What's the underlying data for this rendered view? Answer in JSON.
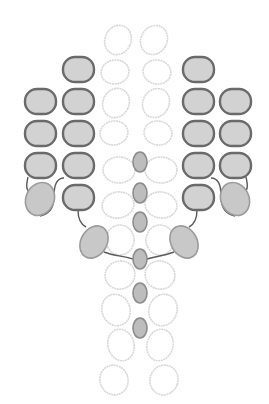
{
  "colors": {
    "background": "#ffffff",
    "pill_fill": "#d2d2d2",
    "pill_stroke": "#6a6a6a",
    "blob_fill": "#c8c8c8",
    "blob_stroke": "#9c9c9c",
    "node_fill": "#bdbdbd",
    "node_stroke": "#8c8c8c",
    "ring_stroke": "#d8d8d8",
    "link_stroke": "#5a5a5a"
  },
  "rings": [
    {
      "cx": 118,
      "cy": 40,
      "rx": 13,
      "ry": 15,
      "rot": 25
    },
    {
      "cx": 154,
      "cy": 40,
      "rx": 13,
      "ry": 15,
      "rot": 30
    },
    {
      "cx": 115,
      "cy": 72,
      "rx": 14,
      "ry": 12,
      "rot": -10
    },
    {
      "cx": 157,
      "cy": 72,
      "rx": 14,
      "ry": 12,
      "rot": 10
    },
    {
      "cx": 116,
      "cy": 103,
      "rx": 13,
      "ry": 15,
      "rot": 25
    },
    {
      "cx": 156,
      "cy": 103,
      "rx": 13,
      "ry": 15,
      "rot": 30
    },
    {
      "cx": 114,
      "cy": 133,
      "rx": 14,
      "ry": 12,
      "rot": -10
    },
    {
      "cx": 158,
      "cy": 133,
      "rx": 14,
      "ry": 12,
      "rot": 10
    },
    {
      "cx": 119,
      "cy": 170,
      "rx": 16,
      "ry": 13,
      "rot": 0
    },
    {
      "cx": 161,
      "cy": 170,
      "rx": 16,
      "ry": 13,
      "rot": 0
    },
    {
      "cx": 118,
      "cy": 205,
      "rx": 16,
      "ry": 13,
      "rot": -10
    },
    {
      "cx": 161,
      "cy": 205,
      "rx": 16,
      "ry": 13,
      "rot": 10
    },
    {
      "cx": 120,
      "cy": 240,
      "rx": 14,
      "ry": 15,
      "rot": 0
    },
    {
      "cx": 160,
      "cy": 240,
      "rx": 14,
      "ry": 15,
      "rot": 0
    },
    {
      "cx": 120,
      "cy": 275,
      "rx": 15,
      "ry": 14,
      "rot": -20
    },
    {
      "cx": 160,
      "cy": 275,
      "rx": 15,
      "ry": 14,
      "rot": 20
    },
    {
      "cx": 116,
      "cy": 310,
      "rx": 14,
      "ry": 16,
      "rot": -20
    },
    {
      "cx": 163,
      "cy": 310,
      "rx": 14,
      "ry": 16,
      "rot": 20
    },
    {
      "cx": 121,
      "cy": 345,
      "rx": 13,
      "ry": 16,
      "rot": -15
    },
    {
      "cx": 160,
      "cy": 345,
      "rx": 13,
      "ry": 16,
      "rot": 15
    },
    {
      "cx": 114,
      "cy": 380,
      "rx": 14,
      "ry": 15,
      "rot": -20
    },
    {
      "cx": 164,
      "cy": 380,
      "rx": 14,
      "ry": 15,
      "rot": 20
    }
  ],
  "pills": [
    {
      "x": 63,
      "y": 57,
      "w": 31,
      "h": 25
    },
    {
      "x": 25,
      "y": 89,
      "w": 31,
      "h": 25
    },
    {
      "x": 63,
      "y": 89,
      "w": 31,
      "h": 25
    },
    {
      "x": 25,
      "y": 121,
      "w": 31,
      "h": 25
    },
    {
      "x": 63,
      "y": 121,
      "w": 31,
      "h": 25
    },
    {
      "x": 25,
      "y": 153,
      "w": 31,
      "h": 25
    },
    {
      "x": 63,
      "y": 153,
      "w": 31,
      "h": 25
    },
    {
      "x": 63,
      "y": 185,
      "w": 31,
      "h": 25
    },
    {
      "x": 183,
      "y": 57,
      "w": 31,
      "h": 25
    },
    {
      "x": 183,
      "y": 89,
      "w": 31,
      "h": 25
    },
    {
      "x": 220,
      "y": 89,
      "w": 31,
      "h": 25
    },
    {
      "x": 183,
      "y": 121,
      "w": 31,
      "h": 25
    },
    {
      "x": 220,
      "y": 121,
      "w": 31,
      "h": 25
    },
    {
      "x": 183,
      "y": 153,
      "w": 31,
      "h": 25
    },
    {
      "x": 220,
      "y": 153,
      "w": 31,
      "h": 25
    },
    {
      "x": 183,
      "y": 185,
      "w": 31,
      "h": 25
    }
  ],
  "blobs": [
    {
      "cx": 40,
      "cy": 199,
      "rx": 14,
      "ry": 17,
      "rot": 25
    },
    {
      "cx": 94,
      "cy": 242,
      "rx": 13,
      "ry": 17,
      "rot": 30
    },
    {
      "cx": 184,
      "cy": 242,
      "rx": 13,
      "ry": 17,
      "rot": -30
    },
    {
      "cx": 235,
      "cy": 199,
      "rx": 14,
      "ry": 17,
      "rot": -25
    }
  ],
  "nodes": [
    {
      "cx": 140,
      "cy": 162,
      "rx": 7,
      "ry": 10
    },
    {
      "cx": 140,
      "cy": 193,
      "rx": 7,
      "ry": 10
    },
    {
      "cx": 140,
      "cy": 222,
      "rx": 7,
      "ry": 10
    },
    {
      "cx": 140,
      "cy": 259,
      "rx": 7,
      "ry": 10
    },
    {
      "cx": 140,
      "cy": 293,
      "rx": 7,
      "ry": 10
    },
    {
      "cx": 140,
      "cy": 328,
      "rx": 7,
      "ry": 10
    }
  ],
  "links": [
    "M28,177 C26,186 26,190 30,192",
    "M64,178 C56,178 54,186 54,196 C54,210 48,214 40,216",
    "M78,210 C78,218 80,224 86,227",
    "M104,252 C114,256 124,256 133,259",
    "M246,177 C248,186 248,190 244,192",
    "M211,178 C219,178 221,186 221,196 C221,210 227,214 235,216",
    "M197,210 C197,218 195,224 189,227",
    "M174,252 C164,256 156,256 147,259"
  ]
}
